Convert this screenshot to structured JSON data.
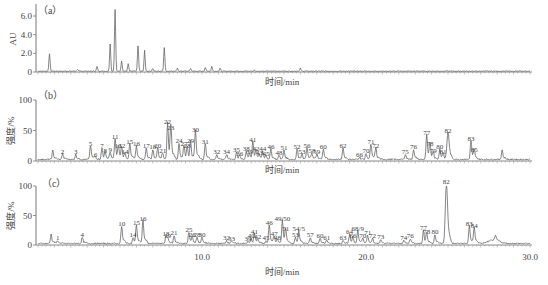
{
  "chart_data": [
    {
      "panel": "(a)",
      "type": "line",
      "ylabel": "AU",
      "xlabel": "时间/min",
      "yticks": [
        "0",
        "2.0",
        "4.0",
        "6.0"
      ],
      "ylim": [
        0,
        7
      ],
      "xlim": [
        0,
        30
      ],
      "grid": false,
      "peaks": [
        {
          "t": 0.7,
          "h": 1.9
        },
        {
          "t": 2.4,
          "h": 0.2
        },
        {
          "t": 3.6,
          "h": 0.5
        },
        {
          "t": 4.4,
          "h": 2.9
        },
        {
          "t": 4.7,
          "h": 6.6
        },
        {
          "t": 5.1,
          "h": 1.1
        },
        {
          "t": 5.5,
          "h": 0.8
        },
        {
          "t": 6.1,
          "h": 2.7
        },
        {
          "t": 6.5,
          "h": 2.2
        },
        {
          "t": 7.0,
          "h": 0.3
        },
        {
          "t": 7.7,
          "h": 2.5
        },
        {
          "t": 8.5,
          "h": 0.3
        },
        {
          "t": 9.3,
          "h": 0.3
        },
        {
          "t": 10.2,
          "h": 0.4
        },
        {
          "t": 10.6,
          "h": 0.5
        },
        {
          "t": 11.1,
          "h": 0.3
        },
        {
          "t": 13.2,
          "h": 0.1
        },
        {
          "t": 16.0,
          "h": 0.3
        }
      ]
    },
    {
      "panel": "(b)",
      "type": "line",
      "ylabel": "强度/%",
      "xlabel": "时间/min",
      "yticks": [
        "0",
        "50",
        "100"
      ],
      "ylim": [
        0,
        100
      ],
      "xlim": [
        0,
        30
      ],
      "grid": false,
      "peaks": [
        {
          "id": "",
          "t": 0.9,
          "h": 14
        },
        {
          "id": "2",
          "t": 1.5,
          "h": 9
        },
        {
          "id": "3",
          "t": 2.3,
          "h": 8
        },
        {
          "id": "5",
          "t": 3.2,
          "h": 22
        },
        {
          "id": "6",
          "t": 3.5,
          "h": 4
        },
        {
          "id": "7",
          "t": 3.9,
          "h": 18
        },
        {
          "id": "8",
          "t": 4.1,
          "h": 10
        },
        {
          "id": "9",
          "t": 4.4,
          "h": 12
        },
        {
          "id": "11",
          "t": 4.7,
          "h": 32
        },
        {
          "id": "13",
          "t": 4.9,
          "h": 18
        },
        {
          "id": "12",
          "t": 5.1,
          "h": 18
        },
        {
          "id": "14",
          "t": 5.3,
          "h": 8
        },
        {
          "id": "15",
          "t": 5.6,
          "h": 25
        },
        {
          "id": "16",
          "t": 6.0,
          "h": 22
        },
        {
          "id": "17",
          "t": 6.6,
          "h": 18
        },
        {
          "id": "18",
          "t": 7.0,
          "h": 16
        },
        {
          "id": "20",
          "t": 7.3,
          "h": 18
        },
        {
          "id": "21",
          "t": 7.6,
          "h": 10
        },
        {
          "id": "22",
          "t": 7.9,
          "h": 58
        },
        {
          "id": "23",
          "t": 8.1,
          "h": 48
        },
        {
          "id": "24",
          "t": 8.6,
          "h": 26
        },
        {
          "id": "27",
          "t": 8.9,
          "h": 22
        },
        {
          "id": "28",
          "t": 9.1,
          "h": 18
        },
        {
          "id": "29",
          "t": 9.3,
          "h": 27
        },
        {
          "id": "30",
          "t": 9.6,
          "h": 45
        },
        {
          "id": "31",
          "t": 10.2,
          "h": 25
        },
        {
          "id": "32",
          "t": 10.9,
          "h": 8
        },
        {
          "id": "34",
          "t": 11.5,
          "h": 8
        },
        {
          "id": "35",
          "t": 12.1,
          "h": 11
        },
        {
          "id": "36",
          "t": 12.3,
          "h": 5
        },
        {
          "id": "38",
          "t": 12.7,
          "h": 13
        },
        {
          "id": "39",
          "t": 12.9,
          "h": 8
        },
        {
          "id": "41",
          "t": 13.1,
          "h": 28
        },
        {
          "id": "42",
          "t": 13.3,
          "h": 13
        },
        {
          "id": "43",
          "t": 13.5,
          "h": 6
        },
        {
          "id": "44",
          "t": 13.7,
          "h": 13
        },
        {
          "id": "45",
          "t": 13.9,
          "h": 5
        },
        {
          "id": "46",
          "t": 14.2,
          "h": 16
        },
        {
          "id": "48",
          "t": 14.7,
          "h": 7
        },
        {
          "id": "51",
          "t": 15.0,
          "h": 14
        },
        {
          "id": "52",
          "t": 15.8,
          "h": 17
        },
        {
          "id": "53",
          "t": 16.1,
          "h": 8
        },
        {
          "id": "56",
          "t": 16.4,
          "h": 18
        },
        {
          "id": "58",
          "t": 16.7,
          "h": 10
        },
        {
          "id": "59",
          "t": 17.0,
          "h": 8
        },
        {
          "id": "60",
          "t": 17.4,
          "h": 17
        },
        {
          "id": "62",
          "t": 18.6,
          "h": 18
        },
        {
          "id": "66",
          "t": 19.6,
          "h": 4
        },
        {
          "id": "70",
          "t": 20.0,
          "h": 10
        },
        {
          "id": "71",
          "t": 20.3,
          "h": 24
        },
        {
          "id": "72",
          "t": 20.6,
          "h": 18
        },
        {
          "id": "75",
          "t": 22.4,
          "h": 8
        },
        {
          "id": "76",
          "t": 22.9,
          "h": 16
        },
        {
          "id": "77",
          "t": 23.7,
          "h": 39
        },
        {
          "id": "78",
          "t": 23.9,
          "h": 22
        },
        {
          "id": "79",
          "t": 24.1,
          "h": 10
        },
        {
          "id": "80",
          "t": 24.5,
          "h": 17
        },
        {
          "id": "81",
          "t": 24.7,
          "h": 9
        },
        {
          "id": "82",
          "t": 25.0,
          "h": 43
        },
        {
          "id": "83",
          "t": 26.4,
          "h": 30
        },
        {
          "id": "85",
          "t": 26.6,
          "h": 12
        },
        {
          "id": "",
          "t": 28.3,
          "h": 15
        }
      ]
    },
    {
      "panel": "(c)",
      "type": "line",
      "ylabel": "强度/%",
      "xlabel": "时间/min",
      "yticks": [
        "0",
        "50",
        "100"
      ],
      "xticks": [
        "10.0",
        "20.0",
        "30.0"
      ],
      "ylim": [
        0,
        100
      ],
      "xlim": [
        0,
        30
      ],
      "grid": false,
      "peaks": [
        {
          "id": "",
          "t": 0.8,
          "h": 15
        },
        {
          "id": "1",
          "t": 1.2,
          "h": 5
        },
        {
          "id": "4",
          "t": 2.7,
          "h": 10
        },
        {
          "id": "10",
          "t": 5.1,
          "h": 28
        },
        {
          "id": "14",
          "t": 5.8,
          "h": 10
        },
        {
          "id": "15",
          "t": 6.0,
          "h": 30
        },
        {
          "id": "16",
          "t": 6.4,
          "h": 38
        },
        {
          "id": "18",
          "t": 7.8,
          "h": 12
        },
        {
          "id": "19",
          "t": 7.9,
          "h": 8
        },
        {
          "id": "21",
          "t": 8.3,
          "h": 13
        },
        {
          "id": "25",
          "t": 9.2,
          "h": 18
        },
        {
          "id": "26",
          "t": 9.4,
          "h": 10
        },
        {
          "id": "28",
          "t": 9.7,
          "h": 10
        },
        {
          "id": "30",
          "t": 10.0,
          "h": 10
        },
        {
          "id": "32",
          "t": 11.5,
          "h": 5
        },
        {
          "id": "33",
          "t": 11.8,
          "h": 4
        },
        {
          "id": "39",
          "t": 12.8,
          "h": 3
        },
        {
          "id": "40",
          "t": 13.0,
          "h": 8
        },
        {
          "id": "41",
          "t": 13.2,
          "h": 16
        },
        {
          "id": "42",
          "t": 13.4,
          "h": 6
        },
        {
          "id": "45",
          "t": 13.9,
          "h": 5
        },
        {
          "id": "46",
          "t": 14.1,
          "h": 30
        },
        {
          "id": "47",
          "t": 14.4,
          "h": 12
        },
        {
          "id": "48",
          "t": 14.6,
          "h": 5
        },
        {
          "id": "49/50",
          "t": 14.9,
          "h": 38
        },
        {
          "id": "51",
          "t": 15.1,
          "h": 20
        },
        {
          "id": "53",
          "t": 15.7,
          "h": 10
        },
        {
          "id": "54/5",
          "t": 15.9,
          "h": 20
        },
        {
          "id": "57",
          "t": 16.6,
          "h": 10
        },
        {
          "id": "60",
          "t": 17.2,
          "h": 9
        },
        {
          "id": "61",
          "t": 17.6,
          "h": 5
        },
        {
          "id": "63",
          "t": 18.6,
          "h": 5
        },
        {
          "id": "64",
          "t": 19.0,
          "h": 15
        },
        {
          "id": "66",
          "t": 19.2,
          "h": 9
        },
        {
          "id": "68/9",
          "t": 19.5,
          "h": 21
        },
        {
          "id": "70",
          "t": 19.8,
          "h": 8
        },
        {
          "id": "71",
          "t": 20.1,
          "h": 13
        },
        {
          "id": "72",
          "t": 20.4,
          "h": 8
        },
        {
          "id": "73",
          "t": 20.9,
          "h": 6
        },
        {
          "id": "74",
          "t": 22.3,
          "h": 5
        },
        {
          "id": "76",
          "t": 22.7,
          "h": 8
        },
        {
          "id": "77",
          "t": 23.5,
          "h": 22
        },
        {
          "id": "78",
          "t": 23.7,
          "h": 15
        },
        {
          "id": "80",
          "t": 24.2,
          "h": 15
        },
        {
          "id": "82",
          "t": 24.9,
          "h": 100
        },
        {
          "id": "83",
          "t": 26.3,
          "h": 29
        },
        {
          "id": "84",
          "t": 26.6,
          "h": 26
        },
        {
          "id": "",
          "t": 27.9,
          "h": 7
        }
      ]
    }
  ],
  "figure": {
    "panel_a_label": "（a）",
    "panel_b_label": "（b）",
    "panel_c_label": "（c）",
    "y_label_a": "AU",
    "y_label_bc": "强度/%",
    "x_label": "时间/min"
  }
}
